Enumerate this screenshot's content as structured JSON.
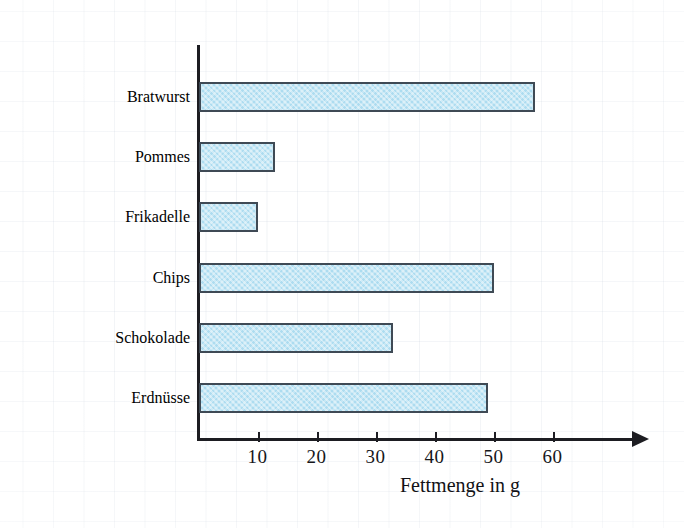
{
  "chart_data": {
    "type": "bar",
    "orientation": "horizontal",
    "title": "",
    "xlabel": "Fettmenge in g",
    "ylabel": "",
    "categories": [
      "Bratwurst",
      "Pommes",
      "Frikadelle",
      "Chips",
      "Schokolade",
      "Erdnüsse"
    ],
    "values": [
      57,
      13,
      10,
      50,
      33,
      49
    ],
    "xticks": [
      10,
      20,
      30,
      40,
      50,
      60
    ],
    "xlim": [
      0,
      74
    ],
    "grid": true,
    "legend": null,
    "bar_color": "#addcf0",
    "bar_border_color": "#3f4a55",
    "axis_color": "#1d1d22"
  },
  "axis": {
    "title": "Fettmenge in g",
    "tick_labels": [
      "10",
      "20",
      "30",
      "40",
      "50",
      "60"
    ]
  },
  "categories": [
    {
      "label": "Bratwurst",
      "value": 57
    },
    {
      "label": "Pommes",
      "value": 13
    },
    {
      "label": "Frikadelle",
      "value": 10
    },
    {
      "label": "Chips",
      "value": 50
    },
    {
      "label": "Schokolade",
      "value": 33
    },
    {
      "label": "Erdnüsse",
      "value": 49
    }
  ]
}
